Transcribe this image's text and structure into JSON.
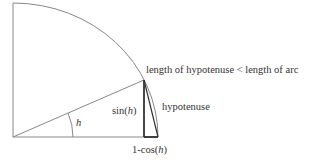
{
  "diagram": {
    "title_annotation": "length of hypotenuse < length of arc",
    "labels": {
      "sin": "sin(",
      "sin_var": "h",
      "sin_close": ")",
      "angle": "h",
      "hypotenuse": "hypotenuse",
      "one_minus_cos": "1-cos(",
      "cos_var": "h",
      "cos_close": ")"
    },
    "geometry": {
      "origin": [
        13,
        137
      ],
      "radius_x": 145,
      "radius_y": 134,
      "point_on_arc": [
        144,
        80
      ],
      "foot": [
        144,
        137
      ],
      "arc_end": [
        158,
        137
      ]
    },
    "colors": {
      "line": "#777777",
      "thick_line": "#333333",
      "text": "#333333"
    }
  }
}
